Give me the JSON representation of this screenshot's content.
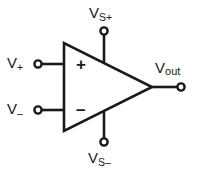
{
  "figure": {
    "type": "circuit-diagram",
    "width": 202,
    "height": 174,
    "background_color": "#ffffff",
    "line_color": "#1a1a1a",
    "text_color": "#1a1a1a"
  },
  "labels": {
    "v_plus": {
      "base": "V",
      "sub": "+",
      "full": "V+"
    },
    "v_minus": {
      "base": "V",
      "sub": "–",
      "full": "V–"
    },
    "v_supply_plus": {
      "base": "V",
      "sub": "S+",
      "full": "VS+"
    },
    "v_supply_minus": {
      "base": "V",
      "sub": "S–",
      "full": "VS–"
    },
    "v_out": {
      "base": "V",
      "sub": "out",
      "full": "Vout"
    }
  },
  "symbols": {
    "noninverting": "+",
    "inverting": "–"
  },
  "terminals": [
    {
      "name": "noninverting-input",
      "label": "V+",
      "x": 38,
      "y": 64
    },
    {
      "name": "inverting-input",
      "label": "V–",
      "x": 38,
      "y": 110
    },
    {
      "name": "positive-supply",
      "label": "VS+",
      "x": 104,
      "y": 31
    },
    {
      "name": "negative-supply",
      "label": "VS–",
      "x": 104,
      "y": 142
    },
    {
      "name": "output",
      "label": "Vout",
      "x": 181,
      "y": 87
    }
  ],
  "body": {
    "shape": "triangle",
    "left_x": 64,
    "top_y": 43,
    "bottom_y": 131,
    "apex_x": 152,
    "apex_y": 87
  }
}
